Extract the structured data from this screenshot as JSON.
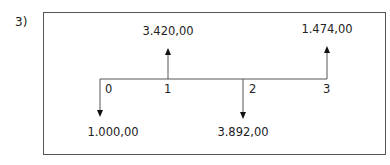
{
  "problem_number": "3)",
  "diagram": {
    "type": "cash-flow-timeline",
    "periods": [
      "0",
      "1",
      "2",
      "3"
    ],
    "flows": [
      {
        "period": "0",
        "direction": "down",
        "value": "1.000,00"
      },
      {
        "period": "1",
        "direction": "up",
        "value": "3.420,00"
      },
      {
        "period": "2",
        "direction": "down",
        "value": "3.892,00"
      },
      {
        "period": "3",
        "direction": "up",
        "value": "1.474,00"
      }
    ],
    "line_color": "#555555",
    "arrow_color": "#111111"
  }
}
